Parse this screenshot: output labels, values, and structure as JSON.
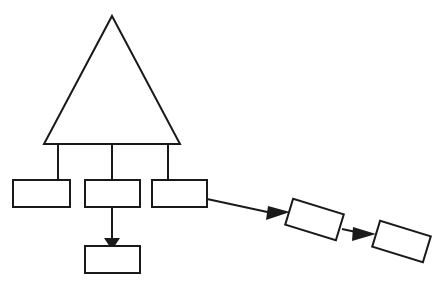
{
  "canvas": {
    "width": 444,
    "height": 287,
    "background_color": "#ffffff",
    "stroke_color": "#1a1a1a",
    "fill_color": "#ffffff",
    "stroke_width": 2
  },
  "diagram": {
    "type": "block-diagram",
    "title": "",
    "nodes": [
      {
        "id": "triangle-top",
        "shape": "triangle",
        "label": "",
        "points": "112,16 180,144 44,144",
        "apex_x": 112,
        "apex_y": 16,
        "base_left_x": 44,
        "base_right_x": 180,
        "base_y": 144
      },
      {
        "id": "box-1",
        "shape": "rectangle",
        "label": "",
        "x": 13,
        "y": 180,
        "width": 57,
        "height": 27,
        "rotation": 0
      },
      {
        "id": "box-2",
        "shape": "rectangle",
        "label": "",
        "x": 85,
        "y": 180,
        "width": 55,
        "height": 27,
        "rotation": 0
      },
      {
        "id": "box-3",
        "shape": "rectangle",
        "label": "",
        "x": 152,
        "y": 180,
        "width": 55,
        "height": 27,
        "rotation": 0
      },
      {
        "id": "box-4",
        "shape": "rectangle",
        "label": "",
        "x": 288,
        "y": 206,
        "width": 53,
        "height": 27,
        "rotation": 17
      },
      {
        "id": "box-5",
        "shape": "rectangle",
        "label": "",
        "x": 375,
        "y": 228,
        "width": 53,
        "height": 27,
        "rotation": 17
      },
      {
        "id": "box-6",
        "shape": "rectangle",
        "label": "",
        "x": 85,
        "y": 246,
        "width": 55,
        "height": 27,
        "rotation": 0
      }
    ],
    "edges": [
      {
        "id": "edge-triangle-box1",
        "from": "triangle-top",
        "to": "box-1",
        "path": "M58,144 L58,180",
        "arrow": false
      },
      {
        "id": "edge-triangle-box2",
        "from": "triangle-top",
        "to": "box-2",
        "path": "M112,144 L112,180",
        "arrow": false
      },
      {
        "id": "edge-triangle-box3",
        "from": "triangle-top",
        "to": "box-3",
        "path": "M168,144 L168,180",
        "arrow": false
      },
      {
        "id": "edge-triangle-base-rail",
        "from": "triangle-top",
        "to": "box-rail",
        "path": "M44,144 L180,144",
        "arrow": false
      },
      {
        "id": "edge-box2-box6",
        "from": "box-2",
        "to": "box-6",
        "path": "M112,207 L112,240",
        "arrow": true,
        "arrow_points": "104,238 120,238 112,250"
      },
      {
        "id": "edge-box3-box4",
        "from": "box-3",
        "to": "box-4",
        "path": "M207,199 L272,213",
        "arrow": true,
        "arrow_points": "268,206 290,212 266,220"
      },
      {
        "id": "edge-box4-box5",
        "from": "box-4",
        "to": "box-5",
        "path": "M342,229 L356,232",
        "arrow": true,
        "arrow_points": "353,227 376,234 352,241"
      }
    ]
  }
}
